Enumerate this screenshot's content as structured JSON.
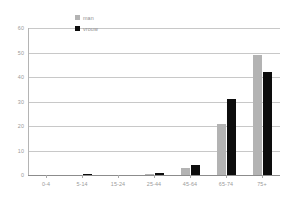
{
  "chart_data": {
    "type": "bar",
    "title": "",
    "subtitle": "",
    "xlabel": "",
    "ylabel": "",
    "categories": [
      "0-4",
      "5-14",
      "15-24",
      "25-44",
      "45-64",
      "65-74",
      "75+"
    ],
    "series": [
      {
        "name": "man",
        "color": "#b3b3b3",
        "values": [
          0,
          0,
          0,
          0.5,
          3,
          21,
          49
        ]
      },
      {
        "name": "vrouw",
        "color": "#0d0d0d",
        "values": [
          0,
          0.6,
          0,
          0.7,
          4,
          31,
          42
        ]
      }
    ],
    "ylim": [
      0,
      60
    ],
    "yticks": [
      0,
      10,
      20,
      30,
      40,
      50,
      60
    ],
    "ytick_labels": [
      "0",
      "10",
      "20",
      "30",
      "40",
      "50",
      "60"
    ],
    "grid": true,
    "legend_position": "top-center"
  },
  "legend": {
    "entries": [
      {
        "label": "man",
        "swatch": "man"
      },
      {
        "label": "vrouw",
        "swatch": "vrouw"
      }
    ]
  },
  "colors": {
    "man": "#b3b3b3",
    "vrouw": "#0d0d0d",
    "grid": "#c8c8c8",
    "axis": "#8c8c8c",
    "tick_text": "#9a9a9a",
    "background": "#ffffff"
  }
}
